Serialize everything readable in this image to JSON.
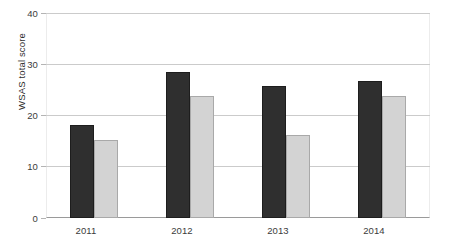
{
  "chart_data": {
    "type": "bar",
    "title": "",
    "subtitle": "",
    "xlabel": "",
    "ylabel": "WSAS total score",
    "categories": [
      "2011",
      "2012",
      "2013",
      "2014"
    ],
    "series": [
      {
        "name": "series-1",
        "color": "#2f2f2f",
        "values": [
          19,
          30,
          27,
          28
        ]
      },
      {
        "name": "series-2",
        "color": "#d3d3d3",
        "values": [
          16,
          25,
          17,
          25
        ]
      }
    ],
    "ylim": [
      0,
      42
    ],
    "yticks": [
      0,
      10,
      20,
      30,
      40
    ],
    "ytick_labels": [
      "0",
      "10",
      "20",
      "30",
      "40"
    ],
    "grid": "horizontal",
    "legend": "none",
    "annotations": [],
    "colors": {
      "series_1": "#2f2f2f",
      "series_2": "#d3d3d3",
      "gridline": "#cbcbcb",
      "axis": "#9a9a9a",
      "text": "#3b3b3b",
      "background": "#ffffff"
    }
  }
}
